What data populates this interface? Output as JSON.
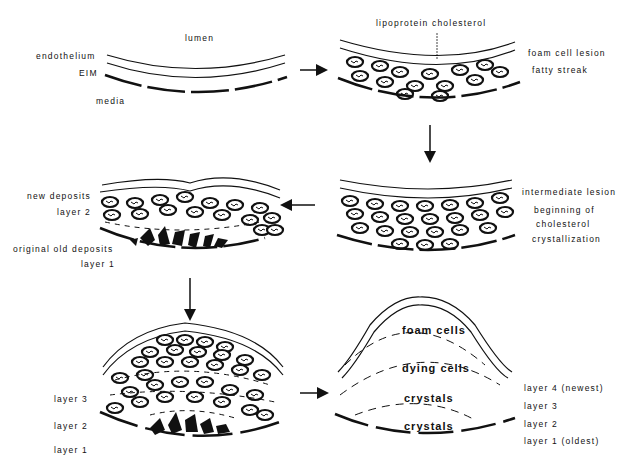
{
  "diagram": {
    "type": "process-flow",
    "panels": [
      {
        "id": "normal-artery",
        "labels": {
          "lumen": "lumen",
          "endothelium": "endothelium",
          "eim": "EIM",
          "media": "media"
        }
      },
      {
        "id": "foam-cell-lesion",
        "labels": {
          "lipoprotein": "lipoprotein cholesterol",
          "foam_cell_lesion": "foam cell lesion",
          "fatty_streak": "fatty streak"
        }
      },
      {
        "id": "intermediate-lesion",
        "labels": {
          "intermediate": "intermediate lesion",
          "beginning": "beginning of",
          "cholesterol": "cholesterol",
          "crystallization": "crystallization"
        }
      },
      {
        "id": "new-deposits",
        "labels": {
          "new_deposits": "new deposits",
          "layer2": "layer 2",
          "original": "original old deposits",
          "layer1": "layer 1"
        }
      },
      {
        "id": "three-layer-plaque",
        "labels": {
          "layer3": "layer 3",
          "layer2": "layer 2",
          "layer1": "layer 1"
        }
      },
      {
        "id": "mature-plaque",
        "labels": {
          "foam_cells": "foam cells",
          "dying_cells": "dying cells",
          "crystals_upper": "crystals",
          "crystals_lower": "crystals",
          "layer4": "layer 4 (newest)",
          "layer3": "layer 3",
          "layer2": "layer 2",
          "layer1": "layer 1 (oldest)"
        }
      }
    ],
    "flow": [
      "normal-artery",
      "foam-cell-lesion",
      "intermediate-lesion",
      "new-deposits",
      "three-layer-plaque",
      "mature-plaque"
    ],
    "colors": {
      "ink": "#111111",
      "background": "#ffffff"
    }
  }
}
